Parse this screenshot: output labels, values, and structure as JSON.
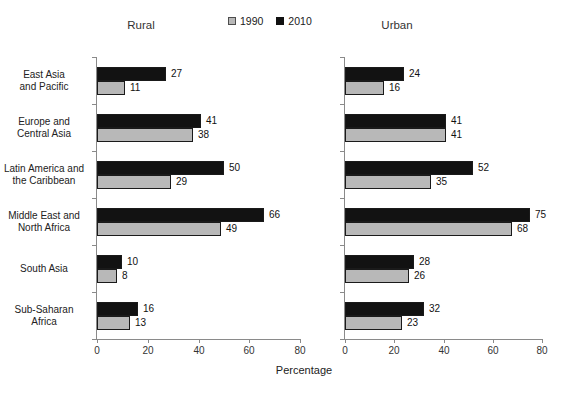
{
  "legend": {
    "items": [
      {
        "label": "1990",
        "color": "#b8b8b8"
      },
      {
        "label": "2010",
        "color": "#121212"
      }
    ]
  },
  "xlabel": "Percentage",
  "chart_data": [
    {
      "type": "bar",
      "orientation": "horizontal",
      "title": "Rural",
      "categories": [
        "East Asia and Pacific",
        "Europe and Central Asia",
        "Latin America and the Caribbean",
        "Middle East and North Africa",
        "South Asia",
        "Sub-Saharan Africa"
      ],
      "category_lines": [
        [
          "East Asia",
          "and Pacific"
        ],
        [
          "Europe and",
          "Central Asia"
        ],
        [
          "Latin America and",
          "the Caribbean"
        ],
        [
          "Middle East and",
          "North Africa"
        ],
        [
          "South Asia"
        ],
        [
          "Sub-Saharan",
          "Africa"
        ]
      ],
      "series": [
        {
          "name": "2010",
          "color": "#121212",
          "values": [
            27,
            41,
            50,
            66,
            10,
            16
          ]
        },
        {
          "name": "1990",
          "color": "#b8b8b8",
          "values": [
            11,
            38,
            29,
            49,
            8,
            13
          ]
        }
      ],
      "xlim": [
        0,
        80
      ],
      "xticks": [
        0,
        20,
        40,
        60,
        80
      ],
      "xlabel": "Percentage",
      "grid": false,
      "legend_position": "top-center",
      "value_labels": true
    },
    {
      "type": "bar",
      "orientation": "horizontal",
      "title": "Urban",
      "categories": [
        "East Asia and Pacific",
        "Europe and Central Asia",
        "Latin America and the Caribbean",
        "Middle East and North Africa",
        "South Asia",
        "Sub-Saharan Africa"
      ],
      "series": [
        {
          "name": "2010",
          "color": "#121212",
          "values": [
            24,
            41,
            52,
            75,
            28,
            32
          ]
        },
        {
          "name": "1990",
          "color": "#b8b8b8",
          "values": [
            16,
            41,
            35,
            68,
            26,
            23
          ]
        }
      ],
      "xlim": [
        0,
        80
      ],
      "xticks": [
        0,
        20,
        40,
        60,
        80
      ],
      "xlabel": "Percentage",
      "grid": false,
      "value_labels": true
    }
  ]
}
